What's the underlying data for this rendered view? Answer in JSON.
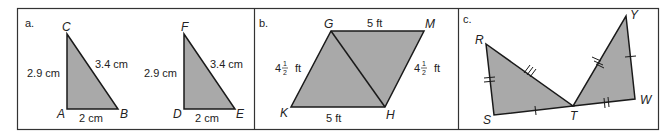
{
  "colors": {
    "fill": "#a9a9a9",
    "stroke": "#1a1a1a",
    "frame": "#333333",
    "background": "#ffffff"
  },
  "panels": [
    {
      "label": "a.",
      "triangles": [
        {
          "vertices": {
            "top": "C",
            "bottom_left": "A",
            "bottom_right": "B"
          },
          "sides": {
            "vertical": "2.9 cm",
            "hypotenuse": "3.4 cm",
            "base": "2 cm"
          }
        },
        {
          "vertices": {
            "top": "F",
            "bottom_left": "D",
            "bottom_right": "E"
          },
          "sides": {
            "vertical": "2.9 cm",
            "hypotenuse": "3.4 cm",
            "base": "2 cm"
          }
        }
      ]
    },
    {
      "label": "b.",
      "vertices": {
        "top_left": "G",
        "top_right": "M",
        "bottom_right": "H",
        "bottom_left": "K"
      },
      "sides": {
        "top": "5 ft",
        "bottom": "5 ft",
        "left_whole": "4",
        "left_num": "1",
        "left_den": "2",
        "left_unit": "ft",
        "right_whole": "4",
        "right_num": "1",
        "right_den": "2",
        "right_unit": "ft"
      }
    },
    {
      "label": "c.",
      "vertices": {
        "r": "R",
        "s": "S",
        "t": "T",
        "w": "W",
        "y": "Y"
      }
    }
  ]
}
